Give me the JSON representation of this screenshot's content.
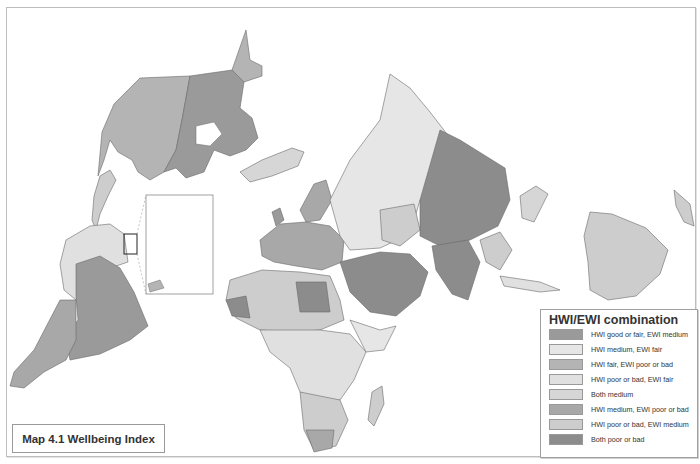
{
  "map": {
    "title": "Map 4.1 Wellbeing Index",
    "projection": "polar-centered world map",
    "regions": [
      {
        "name": "north-america-west",
        "category": 3
      },
      {
        "name": "north-america-east",
        "category": 1
      },
      {
        "name": "greenland",
        "category": 5
      },
      {
        "name": "south-america-main",
        "category": 1
      },
      {
        "name": "south-america-north",
        "category": 4
      },
      {
        "name": "russia",
        "category": 5
      },
      {
        "name": "china",
        "category": 8
      },
      {
        "name": "india",
        "category": 8
      },
      {
        "name": "middle-east",
        "category": 8
      },
      {
        "name": "europe",
        "category": 6
      },
      {
        "name": "africa",
        "category": 7
      },
      {
        "name": "australia",
        "category": 5
      },
      {
        "name": "kazakhstan",
        "category": 3
      }
    ]
  },
  "legend": {
    "title": "HWI/EWI combination",
    "items": [
      {
        "label": "HWI good or fair, EWI medium",
        "color": "#9a9a9a"
      },
      {
        "label": "HWI medium, EWI fair",
        "color": "#e6e6e6"
      },
      {
        "label": "HWI fair, EWI poor or bad",
        "color": "#b4b4b4"
      },
      {
        "label": "HWI poor or bad, EWI fair",
        "color": "#e0e0e0"
      },
      {
        "label": "Both medium",
        "color": "#d6d6d6"
      },
      {
        "label": "HWI medium, EWI poor or bad",
        "color": "#a8a8a8"
      },
      {
        "label": "HWI poor or bad, EWI medium",
        "color": "#cdcdcd"
      },
      {
        "label": "Both poor or bad",
        "color": "#8c8c8c"
      }
    ]
  }
}
